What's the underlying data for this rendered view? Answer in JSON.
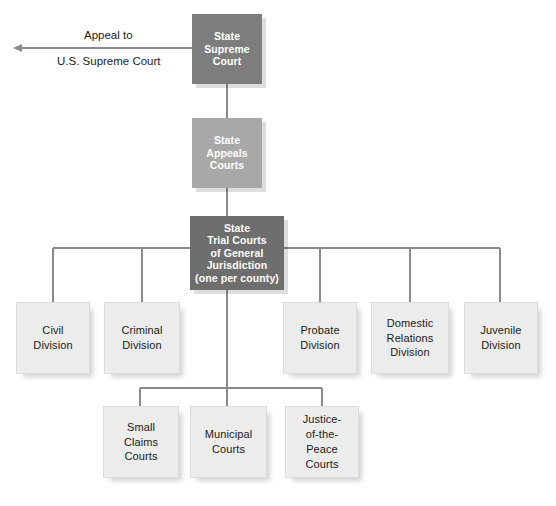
{
  "appeal": {
    "line_top": "Appeal to",
    "line_bottom": "U.S. Supreme Court",
    "arrow": "left-arrow-icon"
  },
  "spine": [
    {
      "id": "state-supreme-court",
      "label": "State\nSupreme\nCourt",
      "color": "#7d7d7d"
    },
    {
      "id": "state-appeals-courts",
      "label": "State\nAppeals\nCourts",
      "color": "#a8a8a8"
    },
    {
      "id": "state-trial-courts",
      "label": "State\nTrial Courts\nof General\nJurisdiction\n(one per county)",
      "color": "#6e6e6e"
    }
  ],
  "divisions": [
    {
      "id": "civil-division",
      "label": "Civil\nDivision"
    },
    {
      "id": "criminal-division",
      "label": "Criminal\nDivision"
    },
    {
      "id": "probate-division",
      "label": "Probate\nDivision"
    },
    {
      "id": "domestic-relations-division",
      "label": "Domestic\nRelations\nDivision"
    },
    {
      "id": "juvenile-division",
      "label": "Juvenile\nDivision"
    }
  ],
  "lower_courts": [
    {
      "id": "small-claims-courts",
      "label": "Small\nClaims\nCourts"
    },
    {
      "id": "municipal-courts",
      "label": "Municipal\nCourts"
    },
    {
      "id": "justice-of-the-peace-courts",
      "label": "Justice-\nof-the-\nPeace\nCourts"
    }
  ],
  "colors": {
    "leaf_fill": "#ececec",
    "leaf_border": "#dcdcdc",
    "wire": "#8a8a8a",
    "text_dark": "#1b1b1b",
    "text_light": "#ffffff"
  }
}
